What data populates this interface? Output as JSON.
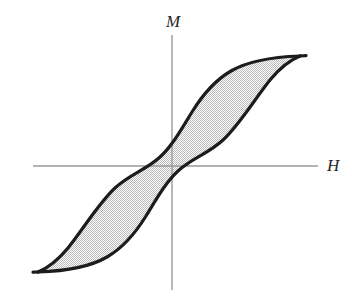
{
  "figure": {
    "kind": "hysteresis-loop-diagram",
    "background_color": "#ffffff",
    "width": 352,
    "height": 301
  },
  "axes": {
    "vertical": {
      "label": "M",
      "label_meaning": "magnetization",
      "color": "#9a9a9a",
      "x": 172,
      "y_top": 35,
      "y_bottom": 290
    },
    "horizontal": {
      "label": "H",
      "label_meaning": "applied magnetic field",
      "color": "#9a9a9a",
      "y": 166,
      "x_left": 33,
      "x_right": 318
    },
    "origin": {
      "x": 172,
      "y": 166
    }
  },
  "curve": {
    "name": "hysteresis-loop",
    "stroke_color": "#1c1c1c",
    "stroke_width": 3.2,
    "fill_color": "#d9d9d9",
    "fill_pattern": "dither-stipple",
    "saturation_upper_right": {
      "x": 300,
      "y": 56
    },
    "saturation_lower_left": {
      "x": 38,
      "y": 272
    },
    "remanence_upper": {
      "x": 172,
      "y": 84
    },
    "remanence_lower": {
      "x": 172,
      "y": 247
    },
    "coercivity_left": {
      "x": 131,
      "y": 166
    },
    "coercivity_right": {
      "x": 210,
      "y": 166
    },
    "upper_branch_path": "M 300 56 C 272 57 248 61 231 71 C 212 82 200 99 192 112 C 181 130 172 146 160 157 C 146 170 130 174 115 188 C 98 204 84 228 68 248 C 58 260 48 268 38 272",
    "lower_branch_path": "M 38 272 C 66 271 90 267 107 257 C 126 246 138 229 146 216 C 157 198 166 182 178 171 C 192 158 208 154 223 140 C 240 124 254 100 270 80 C 280 68 290 60 300 56",
    "upper_cap_path": "M 300 56 L 306 55.6",
    "lower_cap_path": "M 38 272 L 33 272.2"
  },
  "labels": {
    "vertical_axis": "M",
    "horizontal_axis": "H"
  }
}
